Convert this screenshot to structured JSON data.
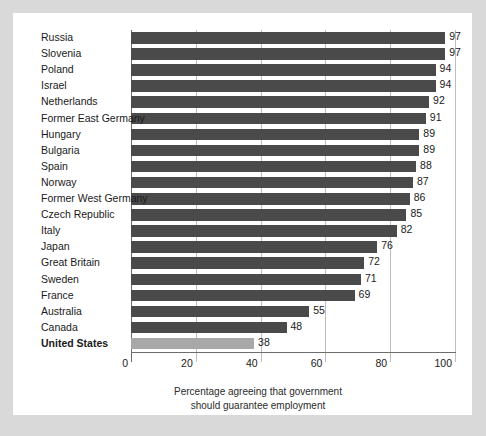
{
  "chart_data": {
    "type": "bar",
    "orientation": "horizontal",
    "title": "",
    "subtitle": "",
    "xlabel": "Percentage agreeing that government should guarantee employment",
    "ylabel": "",
    "xlim": [
      0,
      100
    ],
    "xticks": [
      0,
      20,
      40,
      60,
      80,
      100
    ],
    "xticklabels": [
      "0",
      "20",
      "40",
      "60",
      "80",
      "100"
    ],
    "grid": "vertical",
    "legend": "none",
    "categories": [
      "Russia",
      "Slovenia",
      "Poland",
      "Israel",
      "Netherlands",
      "Former East Germany",
      "Hungary",
      "Bulgaria",
      "Spain",
      "Norway",
      "Former West Germany",
      "Czech Republic",
      "Italy",
      "Japan",
      "Great Britain",
      "Sweden",
      "France",
      "Australia",
      "Canada",
      "United States"
    ],
    "values": [
      97,
      97,
      94,
      94,
      92,
      91,
      89,
      89,
      88,
      87,
      86,
      85,
      82,
      76,
      72,
      71,
      69,
      55,
      48,
      38
    ],
    "value_labels": [
      "97",
      "97",
      "94",
      "94",
      "92",
      "91",
      "89",
      "89",
      "88",
      "87",
      "86",
      "85",
      "82",
      "76",
      "72",
      "71",
      "69",
      "55",
      "48",
      "38"
    ],
    "highlighted_category": "United States",
    "colors": {
      "bar": "#4a4a4a",
      "bar_highlight": "#a8a8a8",
      "gridline": "#bdbdbd",
      "axis": "#6e6e6e",
      "text": "#1a1a1a",
      "card_background": "#ffffff",
      "page_background": "#d9d9d9"
    }
  },
  "caption": {
    "line1": "Percentage agreeing that government",
    "line2": "should guarantee employment"
  }
}
